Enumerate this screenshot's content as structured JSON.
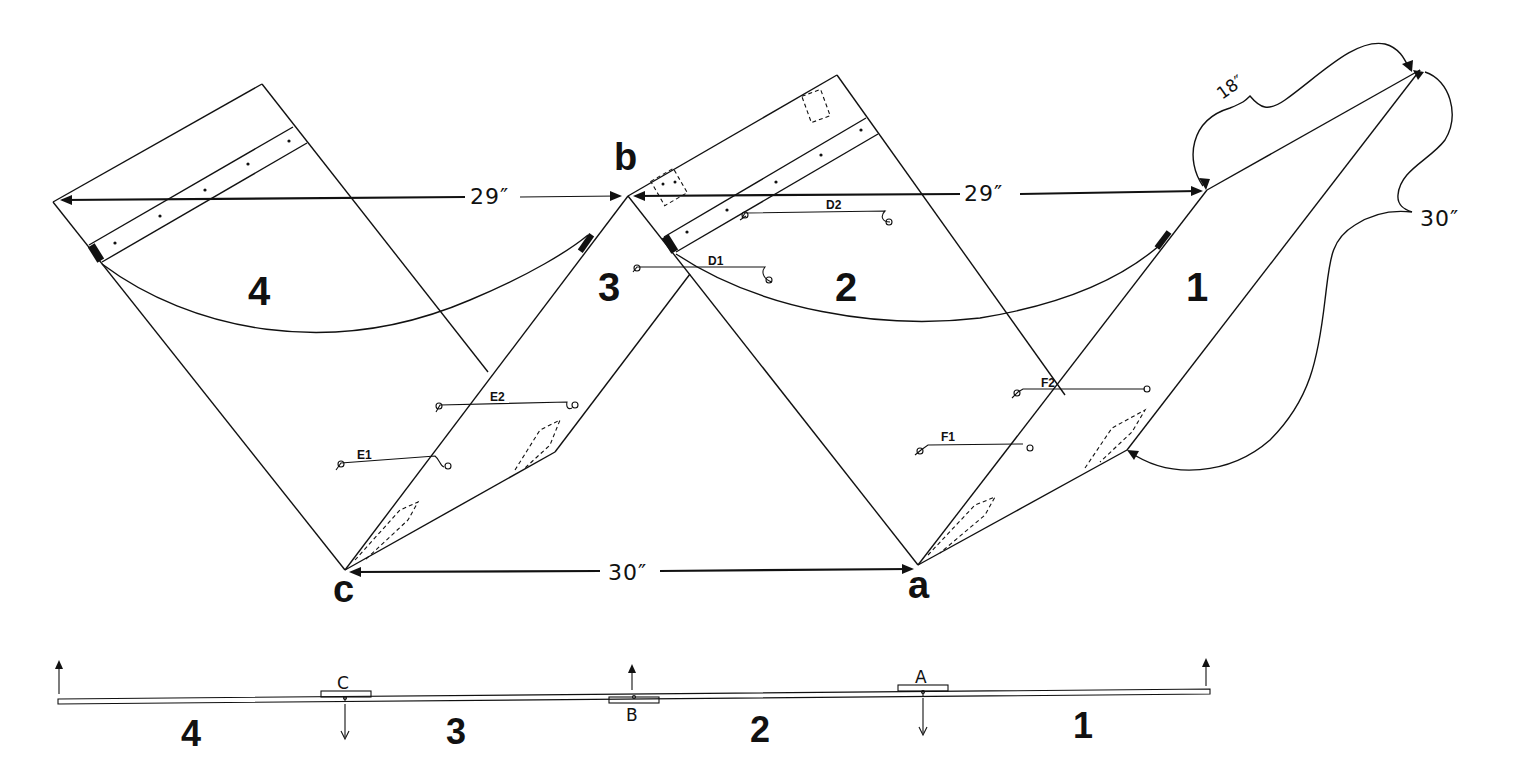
{
  "diagram": {
    "panels": [
      {
        "id": "panel-4",
        "label": "4"
      },
      {
        "id": "panel-3",
        "label": "3"
      },
      {
        "id": "panel-2",
        "label": "2"
      },
      {
        "id": "panel-1",
        "label": "1"
      }
    ],
    "vertices": {
      "a": "a",
      "b": "b",
      "c": "c"
    },
    "dimensions": {
      "top_left": "29″",
      "top_right": "29″",
      "bottom": "30″",
      "corner_short": "18″",
      "corner_long": "30″"
    },
    "cords": {
      "d1": "D1",
      "d2": "D2",
      "e1": "E1",
      "e2": "E2",
      "f1": "F1",
      "f2": "F2"
    },
    "side_view": {
      "hinges": {
        "a": "A",
        "b": "B",
        "c": "C"
      },
      "panel_labels": [
        "4",
        "3",
        "2",
        "1"
      ]
    }
  }
}
